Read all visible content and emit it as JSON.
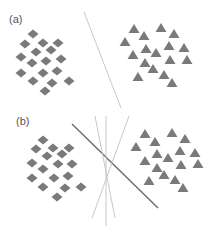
{
  "colors": {
    "marker": "#7a7a7a",
    "dark_line": "#6a6a6a",
    "light_line": "#c8c8c8",
    "label": "#555555"
  },
  "panels": [
    {
      "label": "(a)",
      "label_pos": [
        9,
        14
      ],
      "diamonds": [
        [
          33,
          34
        ],
        [
          25,
          44
        ],
        [
          43,
          43
        ],
        [
          58,
          43
        ],
        [
          36,
          52
        ],
        [
          51,
          50
        ],
        [
          21,
          57
        ],
        [
          32,
          63
        ],
        [
          46,
          61
        ],
        [
          61,
          59
        ],
        [
          21,
          73
        ],
        [
          33,
          81
        ],
        [
          43,
          73
        ],
        [
          57,
          71
        ],
        [
          69,
          81
        ],
        [
          52,
          83
        ],
        [
          45,
          91
        ]
      ],
      "triangles": [
        [
          134,
          29
        ],
        [
          161,
          28
        ],
        [
          174,
          34
        ],
        [
          144,
          36
        ],
        [
          125,
          42
        ],
        [
          169,
          46
        ],
        [
          146,
          49
        ],
        [
          184,
          48
        ],
        [
          156,
          53
        ],
        [
          133,
          55
        ],
        [
          170,
          60
        ],
        [
          187,
          60
        ],
        [
          145,
          63
        ],
        [
          153,
          69
        ],
        [
          138,
          77
        ],
        [
          164,
          75
        ],
        [
          172,
          83
        ]
      ],
      "lines": [
        {
          "x1": 84,
          "y1": 12,
          "x2": 121,
          "y2": 108,
          "style": "light"
        }
      ]
    },
    {
      "label": "(b)",
      "label_pos": [
        16,
        116
      ],
      "diamonds": [
        [
          43,
          140
        ],
        [
          36,
          149
        ],
        [
          53,
          148
        ],
        [
          69,
          148
        ],
        [
          47,
          156
        ],
        [
          62,
          154
        ],
        [
          32,
          163
        ],
        [
          43,
          169
        ],
        [
          58,
          164
        ],
        [
          72,
          164
        ],
        [
          32,
          178
        ],
        [
          54,
          178
        ],
        [
          68,
          176
        ],
        [
          43,
          187
        ],
        [
          65,
          188
        ],
        [
          81,
          187
        ],
        [
          57,
          197
        ]
      ],
      "triangles": [
        [
          145,
          134
        ],
        [
          172,
          133
        ],
        [
          185,
          139
        ],
        [
          155,
          142
        ],
        [
          136,
          147
        ],
        [
          180,
          151
        ],
        [
          157,
          154
        ],
        [
          195,
          153
        ],
        [
          168,
          158
        ],
        [
          145,
          161
        ],
        [
          181,
          165
        ],
        [
          198,
          164
        ],
        [
          157,
          168
        ],
        [
          164,
          175
        ],
        [
          149,
          181
        ],
        [
          175,
          180
        ],
        [
          183,
          188
        ]
      ],
      "lines": [
        {
          "x1": 72,
          "y1": 124,
          "x2": 158,
          "y2": 208,
          "style": "dark"
        },
        {
          "x1": 95,
          "y1": 116,
          "x2": 115,
          "y2": 218,
          "style": "light"
        },
        {
          "x1": 106,
          "y1": 116,
          "x2": 106,
          "y2": 226,
          "style": "light"
        },
        {
          "x1": 129,
          "y1": 116,
          "x2": 92,
          "y2": 218,
          "style": "light"
        }
      ]
    }
  ]
}
